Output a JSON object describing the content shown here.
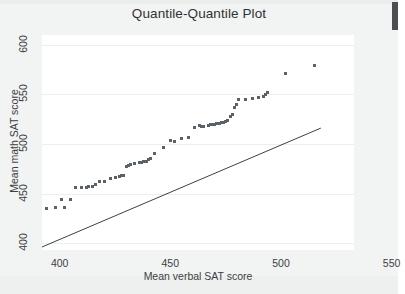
{
  "figure": {
    "background_color": "#f2f3f3",
    "plot_background_color": "#ffffff",
    "marker_color": "#5b6168",
    "line_color": "#3c4145",
    "grid_color": "#eceff0"
  },
  "edge_marker": {
    "name": "page-edge-mark",
    "color": "#4a4f52"
  },
  "chart_data": {
    "type": "scatter",
    "title": "Quantile-Quantile Plot",
    "xlabel": "Mean verbal SAT score",
    "ylabel": "Mean math SAT score",
    "xlim": [
      392,
      533
    ],
    "ylim": [
      393,
      610
    ],
    "xticks": [
      400,
      450,
      500,
      550
    ],
    "xticklabels": [
      "400",
      "450",
      "500",
      "550"
    ],
    "yticks": [
      400,
      450,
      500,
      550,
      600
    ],
    "yticklabels": [
      "400",
      "450",
      "500",
      "550",
      "600"
    ],
    "grid": true,
    "legend": null,
    "series": [
      {
        "name": "quantile points",
        "marker": "square",
        "x": [
          394,
          398,
          401,
          402,
          405,
          407,
          410,
          412,
          413,
          415,
          416,
          418,
          420,
          423,
          425,
          427,
          428,
          429,
          430,
          431,
          432,
          434,
          436,
          437,
          438,
          439,
          440,
          441,
          443,
          447,
          450,
          452,
          455,
          458,
          461,
          463,
          464,
          465,
          467,
          468,
          469,
          470,
          471,
          472,
          473,
          474,
          475,
          476,
          477,
          478,
          479,
          480,
          481,
          484,
          487,
          490,
          492,
          493,
          494,
          502,
          515
        ],
        "y": [
          435,
          436,
          444,
          436,
          444,
          456,
          456,
          456,
          457,
          457,
          459,
          462,
          462,
          465,
          466,
          467,
          468,
          468,
          477,
          478,
          479,
          480,
          481,
          481,
          482,
          482,
          484,
          485,
          490,
          496,
          504,
          503,
          506,
          507,
          517,
          519,
          518,
          518,
          519,
          520,
          520,
          520,
          521,
          521,
          522,
          522,
          523,
          524,
          528,
          530,
          537,
          540,
          545,
          545,
          546,
          547,
          548,
          550,
          552,
          571,
          579
        ]
      }
    ],
    "reference_line": {
      "name": "identity-reference-line",
      "x": [
        392,
        518
      ],
      "y": [
        396,
        516
      ]
    }
  }
}
